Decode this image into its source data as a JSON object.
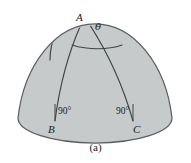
{
  "figure": {
    "caption": "(a)",
    "type": "spherical-triangle-diagram",
    "colors": {
      "dome_fill": "#c6caca",
      "outline": "#5a6060",
      "arc_line": "#3e4444",
      "label_text": "#1b1b1b",
      "background": "#ffffff"
    },
    "labels": {
      "vertex_a": "A",
      "vertex_b": "B",
      "vertex_c": "C",
      "apex_angle": "θ",
      "angle_at_b": "90°",
      "angle_at_c": "90°"
    }
  }
}
